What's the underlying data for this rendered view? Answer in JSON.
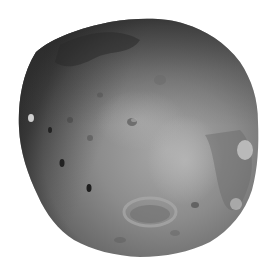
{
  "image": {
    "subject": "rocky moon (Phobos-like body) in grayscale",
    "background_color": "#ffffff",
    "body_colors": {
      "lit_face": "#8a8a8a",
      "highlight": "#a8a8a8",
      "shadow_limb": "#2a2a2a",
      "crater_dark": "#3c3c3c",
      "crater_bright": "#c8c8c8"
    }
  }
}
